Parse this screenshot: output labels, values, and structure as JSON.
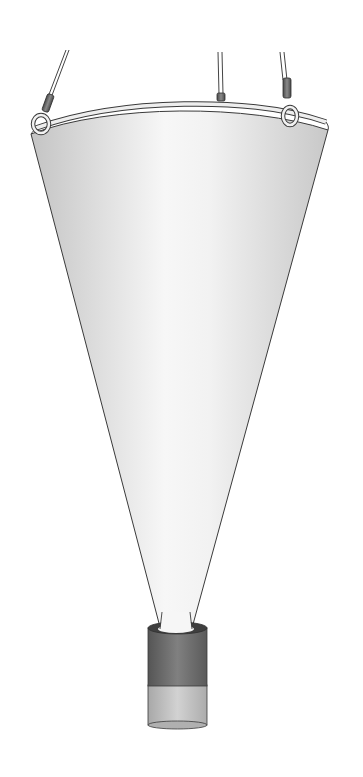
{
  "illustration": {
    "subject": "plankton net",
    "parts": [
      "suspension cords",
      "ring frame",
      "conical net",
      "cod-end collector"
    ]
  },
  "colors": {
    "background": "#ffffff",
    "net_light": "#f4f4f4",
    "net_shade": "#c9c9c9",
    "outline": "#3a3a3a",
    "ring": "#e6e6e6",
    "sleeve": "#6b6b6b",
    "codend_dark": "#6e6e6e",
    "codend_light": "#bdbdbd"
  }
}
